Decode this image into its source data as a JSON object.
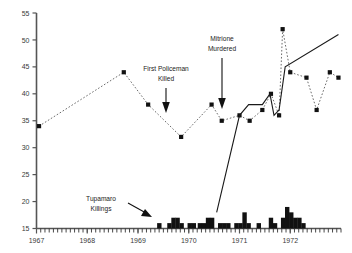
{
  "chart_data": {
    "type": "line",
    "title": "",
    "subtitle": "",
    "xlabel": "",
    "ylabel": "",
    "xlim": [
      1967.0,
      1973.0
    ],
    "ylim": [
      15,
      55
    ],
    "grid": false,
    "legend_position": "none",
    "y_ticks": [
      15,
      20,
      25,
      30,
      35,
      40,
      45,
      50,
      55
    ],
    "y_tick_labels": [
      "15",
      "20",
      "25",
      "30",
      "35",
      "40",
      "45",
      "50",
      "55"
    ],
    "x_ticks": [
      1967,
      1968,
      1969,
      1970,
      1971,
      1972
    ],
    "x_tick_labels": [
      "1967",
      "1968",
      "1969",
      "1970",
      "1971",
      "1972"
    ],
    "series": [
      {
        "name": "dotted-series",
        "style": "dotted",
        "marker": "square",
        "x": [
          1967.05,
          1968.72,
          1969.2,
          1969.85,
          1970.45,
          1970.65,
          1971.0,
          1971.2,
          1971.45,
          1971.62,
          1971.78,
          1971.85,
          1972.0,
          1972.32,
          1972.52,
          1972.78,
          1972.95
        ],
        "y": [
          34,
          44,
          38,
          32,
          38,
          35,
          36,
          35,
          37,
          40,
          36,
          52,
          44,
          43,
          37,
          44,
          43
        ]
      },
      {
        "name": "solid-series",
        "style": "solid",
        "marker": "none",
        "x": [
          1970.55,
          1971.0,
          1971.18,
          1971.45,
          1971.6,
          1971.68,
          1971.78,
          1971.9,
          1972.95
        ],
        "y": [
          18,
          36,
          38,
          38,
          40,
          36,
          37,
          45,
          51
        ]
      },
      {
        "name": "tupamaro-killings-bars",
        "style": "bar",
        "x": [
          1969.42,
          1969.62,
          1969.7,
          1969.78,
          1969.86,
          1970.02,
          1970.1,
          1970.22,
          1970.3,
          1970.38,
          1970.46,
          1970.62,
          1970.7,
          1970.78,
          1970.94,
          1971.02,
          1971.1,
          1971.18,
          1971.38,
          1971.62,
          1971.7,
          1971.86,
          1971.94,
          1972.02,
          1972.1,
          1972.18,
          1972.26
        ],
        "y": [
          16,
          16,
          17,
          17,
          16,
          16,
          16,
          16,
          16,
          17,
          17,
          16,
          16,
          16,
          16,
          16,
          18,
          16,
          16,
          17,
          16,
          17,
          19,
          18,
          17,
          17,
          16
        ]
      }
    ],
    "annotations": [
      {
        "name": "first-policeman-killed",
        "text_line1": "First Policeman",
        "text_line2": "Killed",
        "arrow": "down"
      },
      {
        "name": "mitrione-murdered",
        "text_line1": "Mitrione",
        "text_line2": "Murdered",
        "arrow": "down"
      },
      {
        "name": "tupamaro-killings",
        "text_line1": "Tupamaro",
        "text_line2": "Killings",
        "arrow": "diagonal-down-right"
      }
    ]
  }
}
